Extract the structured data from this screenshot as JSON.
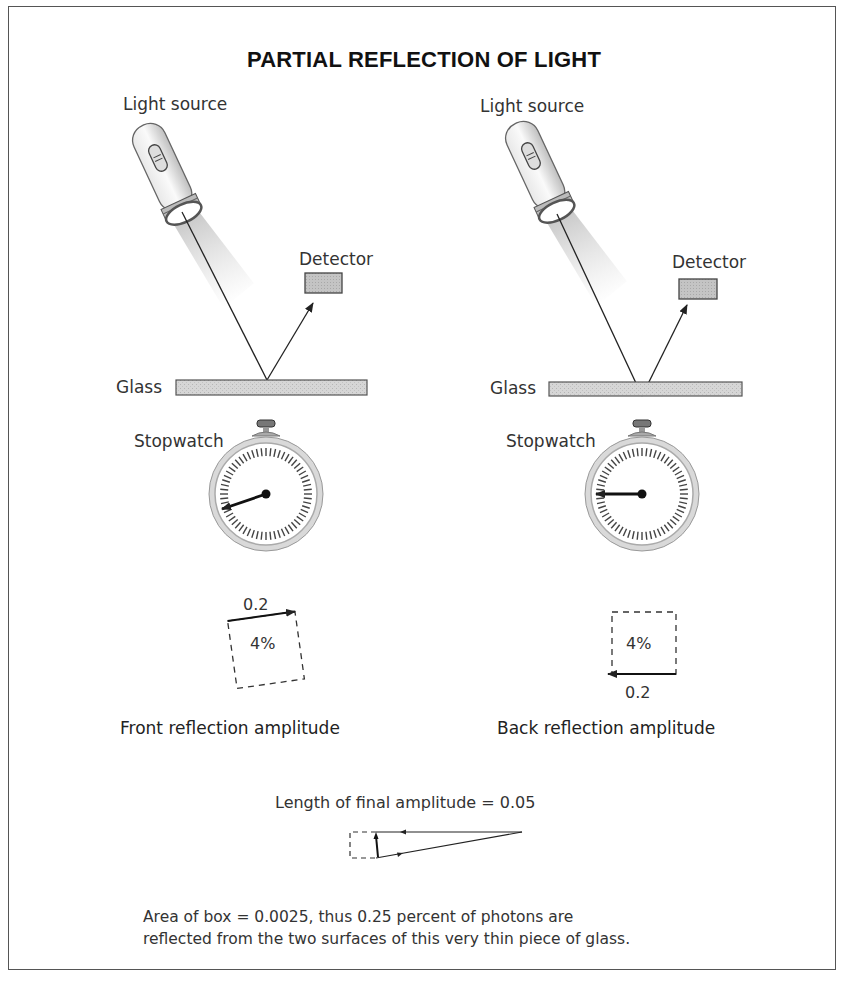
{
  "title": "PARTIAL REFLECTION OF LIGHT",
  "panels": [
    {
      "id": "front",
      "light_source_label": "Light source",
      "detector_label": "Detector",
      "glass_label": "Glass",
      "stopwatch_label": "Stopwatch",
      "amplitude_length": "0.2",
      "probability": "4%",
      "caption": "Front reflection amplitude",
      "reflection_surface": "front"
    },
    {
      "id": "back",
      "light_source_label": "Light source",
      "detector_label": "Detector",
      "glass_label": "Glass",
      "stopwatch_label": "Stopwatch",
      "amplitude_length": "0.2",
      "probability": "4%",
      "caption": "Back reflection amplitude",
      "reflection_surface": "back"
    }
  ],
  "final": {
    "label": "Length of final amplitude = 0.05",
    "note_line1": "Area of box = 0.0025, thus 0.25 percent of photons are",
    "note_line2": "reflected from the two surfaces of this very thin piece of glass."
  },
  "colors": {
    "line": "#222222",
    "glass_fill": "#cfcfcf",
    "detector_fill": "#bdbdbd",
    "frame": "#555555"
  }
}
